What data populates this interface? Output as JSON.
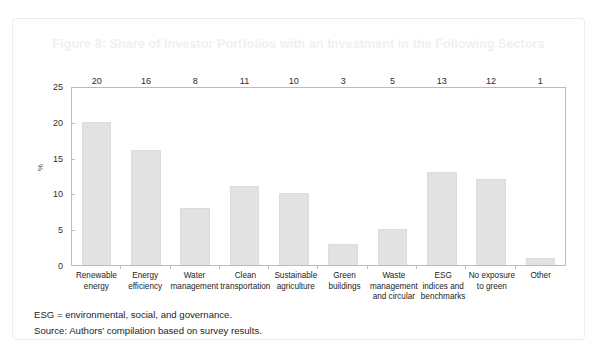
{
  "figure": {
    "title": "Figure 8: Share of Investor Portfolios with an Investment in the Following Sectors",
    "title_color": "#f0f0f2",
    "card_border_color": "#ececee"
  },
  "footnotes": [
    "ESG = environmental, social, and governance.",
    "Source: Authors’ compilation based on survey results."
  ],
  "chart_data": {
    "type": "bar",
    "title": "Figure 8: Share of Investor Portfolios with an Investment in the Following Sectors",
    "xlabel": "",
    "ylabel": "%",
    "ylim": [
      0,
      25
    ],
    "yticks": [
      0,
      5,
      10,
      15,
      20,
      25
    ],
    "ytick_labels": [
      "0",
      "5",
      "10",
      "15",
      "20",
      "25"
    ],
    "grid": false,
    "legend": false,
    "legend_position": "none",
    "bar_color": "#e2e2e2",
    "bar_edge_color": "#dcdcdc",
    "axis_color": "#bcbcbe",
    "data_labels": true,
    "categories": [
      "Renewable energy",
      "Energy efficiency",
      "Water management",
      "Clean transportation",
      "Sustainable agriculture",
      "Green buildings",
      "Waste management and circular",
      "ESG indices and benchmarks",
      "No exposure to green",
      "Other"
    ],
    "category_lines": [
      [
        "Renewable",
        "energy"
      ],
      [
        "Energy",
        "efficiency"
      ],
      [
        "Water",
        "management"
      ],
      [
        "Clean",
        "transportation"
      ],
      [
        "Sustainable",
        "agriculture"
      ],
      [
        "Green",
        "buildings"
      ],
      [
        "Waste",
        "management",
        "and circular"
      ],
      [
        "ESG",
        "indices and",
        "benchmarks"
      ],
      [
        "No exposure",
        "to green"
      ],
      [
        "Other"
      ]
    ],
    "values": [
      20,
      16,
      8,
      11,
      10,
      3,
      5,
      13,
      12,
      1
    ],
    "value_labels": [
      "20",
      "16",
      "8",
      "11",
      "10",
      "3",
      "5",
      "13",
      "12",
      "1"
    ]
  }
}
